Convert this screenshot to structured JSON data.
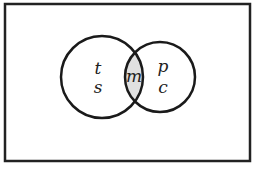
{
  "diagram": {
    "type": "venn",
    "universe": {
      "x": 5,
      "y": 4,
      "width": 245,
      "height": 157,
      "stroke": "#222222"
    },
    "sets": [
      {
        "name": "left-set",
        "cx": 102,
        "cy": 77,
        "r": 41,
        "labels": [
          "t",
          "s"
        ]
      },
      {
        "name": "right-set",
        "cx": 160,
        "cy": 77,
        "r": 35,
        "labels": [
          "p",
          "c"
        ]
      }
    ],
    "intersection": {
      "label": "m",
      "fill": "#e0e0e0"
    },
    "labels": {
      "left_top": "t",
      "left_bottom": "s",
      "intersection": "m",
      "right_top": "p",
      "right_bottom": "c"
    }
  }
}
